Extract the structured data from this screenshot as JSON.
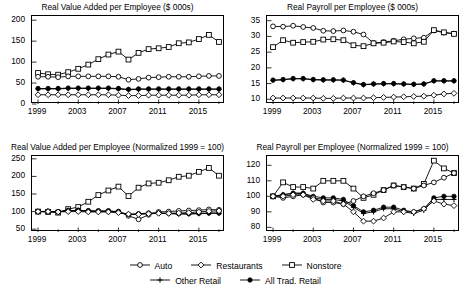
{
  "figure": {
    "background": "#ffffff",
    "line_color": "#000000",
    "panel_count": 4
  },
  "legend": {
    "position": "bottom-center",
    "rows": [
      [
        {
          "label": "Auto",
          "marker": "open-circle",
          "key": "auto"
        },
        {
          "label": "Restaurants",
          "marker": "open-diamond",
          "key": "restaurants"
        },
        {
          "label": "Nonstore",
          "marker": "open-square",
          "key": "nonstore"
        }
      ],
      [
        {
          "label": "Other Retail",
          "marker": "plus",
          "key": "other_retail"
        },
        {
          "label": "All Trad. Retail",
          "marker": "filled-circle",
          "key": "all_trad_retail"
        }
      ]
    ]
  },
  "chart_data": [
    {
      "id": "value-added-levels",
      "type": "line",
      "title": "Real Value Added per Employee ($ 000s)",
      "xlabel": "",
      "ylabel": "",
      "x": [
        1999,
        2000,
        2001,
        2002,
        2003,
        2004,
        2005,
        2006,
        2007,
        2008,
        2009,
        2010,
        2011,
        2012,
        2013,
        2014,
        2015,
        2016,
        2017
      ],
      "xlim": [
        1998.4,
        2017.6
      ],
      "xticks": [
        1999,
        2003,
        2007,
        2011,
        2015
      ],
      "xticklabels": [
        "1999",
        "2003",
        "2007",
        "2011",
        "2015"
      ],
      "ylim": [
        0,
        210
      ],
      "yticks": [
        0,
        50,
        100,
        150,
        200
      ],
      "yticklabels": [
        "0",
        "50",
        "100",
        "150",
        "200"
      ],
      "grid": false,
      "series": [
        {
          "name": "Nonstore",
          "marker": "open-square",
          "values": [
            74,
            71,
            70,
            76,
            84,
            94,
            107,
            118,
            125,
            106,
            122,
            131,
            133,
            136,
            145,
            147,
            155,
            165,
            148
          ]
        },
        {
          "name": "Auto",
          "marker": "open-circle",
          "values": [
            65,
            65,
            64,
            66,
            66,
            66,
            66,
            66,
            65,
            58,
            60,
            63,
            64,
            65,
            65,
            65,
            66,
            67,
            67
          ]
        },
        {
          "name": "All Trad. Retail",
          "marker": "filled-circle",
          "values": [
            37,
            37,
            37,
            38,
            38,
            38,
            38,
            38,
            37,
            35,
            36,
            36,
            36,
            36,
            36,
            36,
            36,
            36,
            36
          ]
        },
        {
          "name": "Other Retail",
          "marker": "plus",
          "values": [
            36,
            36,
            36,
            37,
            37,
            37,
            37,
            37,
            36,
            34,
            35,
            35,
            35,
            35,
            35,
            35,
            35,
            35,
            35
          ]
        },
        {
          "name": "Restaurants",
          "marker": "open-diamond",
          "values": [
            22,
            22,
            22,
            22,
            22,
            22,
            22,
            22,
            21,
            20,
            20,
            21,
            21,
            21,
            21,
            21,
            22,
            22,
            22
          ]
        }
      ]
    },
    {
      "id": "payroll-levels",
      "type": "line",
      "title": "Real Payroll per Employee ($ 000s)",
      "xlabel": "",
      "ylabel": "",
      "x": [
        1999,
        2000,
        2001,
        2002,
        2003,
        2004,
        2005,
        2006,
        2007,
        2008,
        2009,
        2010,
        2011,
        2012,
        2013,
        2014,
        2015,
        2016,
        2017
      ],
      "xlim": [
        1998.4,
        2017.6
      ],
      "xticks": [
        1999,
        2003,
        2007,
        2011,
        2015
      ],
      "xticklabels": [
        "1999",
        "2003",
        "2007",
        "2011",
        "2015"
      ],
      "ylim": [
        8.5,
        36.5
      ],
      "yticks": [
        10,
        15,
        20,
        25,
        30,
        35
      ],
      "yticklabels": [
        "10",
        "15",
        "20",
        "25",
        "30",
        "35"
      ],
      "grid": false,
      "series": [
        {
          "name": "Auto",
          "marker": "open-circle",
          "values": [
            33.2,
            33.1,
            33.4,
            33.0,
            32.7,
            31.8,
            31.7,
            31.9,
            31.5,
            30.6,
            27.9,
            28.2,
            28.6,
            29.1,
            29.4,
            29.6,
            31.9,
            31.2,
            30.9
          ]
        },
        {
          "name": "Nonstore",
          "marker": "open-square",
          "values": [
            26.6,
            28.8,
            28.0,
            28.2,
            28.3,
            29.0,
            29.1,
            28.8,
            27.2,
            26.9,
            27.8,
            28.0,
            28.4,
            28.2,
            27.8,
            28.3,
            32.0,
            31.3,
            30.8
          ]
        },
        {
          "name": "All Trad. Retail",
          "marker": "filled-circle",
          "values": [
            16.1,
            16.3,
            16.6,
            16.6,
            16.3,
            16.2,
            16.2,
            16.1,
            15.3,
            14.7,
            14.9,
            15.0,
            15.0,
            14.9,
            14.8,
            14.9,
            15.9,
            15.9,
            15.9
          ]
        },
        {
          "name": "Other Retail",
          "marker": "plus",
          "values": [
            16.0,
            16.2,
            16.5,
            16.5,
            16.2,
            16.1,
            16.1,
            16.1,
            15.2,
            14.6,
            14.8,
            14.9,
            14.9,
            14.8,
            14.7,
            14.8,
            15.8,
            15.8,
            15.8
          ]
        },
        {
          "name": "Restaurants",
          "marker": "open-diamond",
          "values": [
            10.4,
            10.4,
            10.4,
            10.4,
            10.4,
            10.3,
            10.3,
            10.4,
            10.4,
            10.4,
            10.5,
            10.6,
            10.7,
            10.8,
            10.9,
            11.0,
            11.3,
            11.7,
            11.9
          ]
        }
      ]
    },
    {
      "id": "value-added-normalized",
      "type": "line",
      "title": "Real Value Added per Employee (Normalized 1999 = 100)",
      "xlabel": "",
      "ylabel": "",
      "x": [
        1999,
        2000,
        2001,
        2002,
        2003,
        2004,
        2005,
        2006,
        2007,
        2008,
        2009,
        2010,
        2011,
        2012,
        2013,
        2014,
        2015,
        2016,
        2017
      ],
      "xlim": [
        1998.4,
        2017.6
      ],
      "xticks": [
        1999,
        2003,
        2007,
        2011,
        2015
      ],
      "xticklabels": [
        "1999",
        "2003",
        "2007",
        "2011",
        "2015"
      ],
      "ylim": [
        42,
        258
      ],
      "yticks": [
        50,
        100,
        150,
        200,
        250
      ],
      "yticklabels": [
        "50",
        "100",
        "150",
        "200",
        "250"
      ],
      "grid": false,
      "series": [
        {
          "name": "Nonstore",
          "marker": "open-square",
          "values": [
            100,
            99,
            97,
            107,
            113,
            128,
            147,
            160,
            171,
            144,
            168,
            180,
            182,
            189,
            199,
            202,
            213,
            224,
            202
          ]
        },
        {
          "name": "Auto",
          "marker": "open-circle",
          "values": [
            100,
            101,
            99,
            103,
            103,
            102,
            102,
            102,
            100,
            88,
            78,
            91,
            99,
            100,
            102,
            103,
            104,
            106,
            105
          ]
        },
        {
          "name": "All Trad. Retail",
          "marker": "filled-circle",
          "values": [
            100,
            100,
            100,
            102,
            104,
            102,
            101,
            101,
            99,
            92,
            94,
            96,
            96,
            95,
            94,
            94,
            95,
            96,
            96
          ]
        },
        {
          "name": "Other Retail",
          "marker": "plus",
          "values": [
            100,
            100,
            100,
            102,
            103,
            101,
            100,
            100,
            98,
            91,
            93,
            95,
            95,
            94,
            93,
            93,
            94,
            95,
            95
          ]
        },
        {
          "name": "Restaurants",
          "marker": "open-diamond",
          "values": [
            100,
            100,
            99,
            100,
            100,
            99,
            99,
            99,
            97,
            93,
            92,
            94,
            95,
            95,
            96,
            97,
            99,
            101,
            102
          ]
        }
      ]
    },
    {
      "id": "payroll-normalized",
      "type": "line",
      "title": "Real Payroll per Employee (Normalized 1999 = 100)",
      "xlabel": "",
      "ylabel": "",
      "x": [
        1999,
        2000,
        2001,
        2002,
        2003,
        2004,
        2005,
        2006,
        2007,
        2008,
        2009,
        2010,
        2011,
        2012,
        2013,
        2014,
        2015,
        2016,
        2017
      ],
      "xlim": [
        1998.4,
        2017.6
      ],
      "xticks": [
        1999,
        2003,
        2007,
        2011,
        2015
      ],
      "xticklabels": [
        "1999",
        "2003",
        "2007",
        "2011",
        "2015"
      ],
      "ylim": [
        77,
        126
      ],
      "yticks": [
        80,
        90,
        100,
        110,
        120
      ],
      "yticklabels": [
        "80",
        "90",
        "100",
        "110",
        "120"
      ],
      "grid": false,
      "series": [
        {
          "name": "Nonstore",
          "marker": "open-square",
          "values": [
            100,
            109,
            106,
            106,
            105,
            110,
            110,
            110,
            105,
            99,
            101,
            104,
            107,
            106,
            105,
            108,
            123,
            118,
            115
          ]
        },
        {
          "name": "All Trad. Retail",
          "marker": "filled-circle",
          "values": [
            100,
            101,
            102,
            102,
            100,
            99,
            99,
            98,
            94,
            90,
            91,
            93,
            93,
            91,
            90,
            92,
            99,
            100,
            100
          ]
        },
        {
          "name": "Other Retail",
          "marker": "plus",
          "values": [
            100,
            101,
            102,
            102,
            99,
            98,
            98,
            97,
            93,
            89,
            90,
            92,
            92,
            90,
            89,
            91,
            98,
            98,
            98
          ]
        },
        {
          "name": "Auto",
          "marker": "open-circle",
          "values": [
            100,
            99,
            100,
            101,
            99,
            96,
            96,
            95,
            97,
            100,
            102,
            104,
            107,
            106,
            105,
            107,
            109,
            112,
            115
          ]
        },
        {
          "name": "Restaurants",
          "marker": "open-diamond",
          "values": [
            100,
            100,
            101,
            101,
            98,
            97,
            97,
            95,
            90,
            84,
            84,
            86,
            90,
            90,
            90,
            92,
            97,
            95,
            94
          ]
        }
      ]
    }
  ]
}
